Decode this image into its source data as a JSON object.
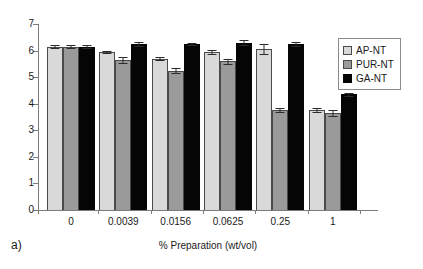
{
  "panel": {
    "label": "a)"
  },
  "chart_data": {
    "type": "bar",
    "title": "",
    "xlabel": "% Preparation (wt/vol)",
    "ylabel": "",
    "categories": [
      "0",
      "0.0039",
      "0.0156",
      "0.0625",
      "0.25",
      "1"
    ],
    "ylim": [
      0,
      7
    ],
    "yticks": [
      0,
      1,
      2,
      3,
      4,
      5,
      6,
      7
    ],
    "ytick_labels": [
      "0",
      "1",
      "2",
      "3",
      "4",
      "5",
      "6",
      "7"
    ],
    "grid": false,
    "legend_position": "upper right",
    "series": [
      {
        "name": "AP-NT",
        "color": "#d9d9d9",
        "values": [
          6.15,
          5.95,
          5.7,
          5.95,
          6.05,
          3.75
        ],
        "errors": [
          0.07,
          0.05,
          0.05,
          0.08,
          0.18,
          0.08
        ]
      },
      {
        "name": "PUR-NT",
        "color": "#9a9a9a",
        "values": [
          6.15,
          5.65,
          5.25,
          5.6,
          3.75,
          3.65
        ],
        "errors": [
          0.07,
          0.1,
          0.08,
          0.1,
          0.08,
          0.1
        ]
      },
      {
        "name": "GA-NT",
        "color": "#050505",
        "values": [
          6.15,
          6.25,
          6.25,
          6.3,
          6.25,
          4.35
        ],
        "errors": [
          0.06,
          0.06,
          0.05,
          0.09,
          0.07,
          0.06
        ]
      }
    ]
  },
  "legend": {
    "items": [
      {
        "label": "AP-NT"
      },
      {
        "label": "PUR-NT"
      },
      {
        "label": "GA-NT"
      }
    ]
  }
}
